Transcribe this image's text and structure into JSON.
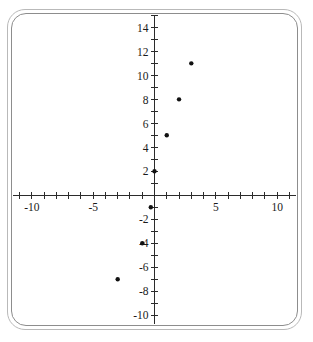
{
  "chart_data": {
    "type": "scatter",
    "title": "",
    "subtitle": "",
    "xlabel": "",
    "ylabel": "",
    "xlim": [
      -11.7,
      11.7
    ],
    "ylim": [
      -10.9,
      15.2
    ],
    "grid": false,
    "legend": null,
    "x_tick_step": 1,
    "y_tick_step": 1,
    "x_labeled_ticks": [
      -10,
      -5,
      5,
      10
    ],
    "y_labeled_ticks": [
      14,
      12,
      10,
      8,
      6,
      4,
      2,
      -2,
      -4,
      -6,
      -8,
      -10
    ],
    "x_tick_labels": [
      "-10",
      "-5",
      "5",
      "10"
    ],
    "y_tick_labels": [
      "14",
      "12",
      "10",
      "8",
      "6",
      "4",
      "2",
      "-2",
      "-4",
      "-6",
      "-8",
      "-10"
    ],
    "points": [
      {
        "x": -3,
        "y": -7
      },
      {
        "x": -1,
        "y": -4
      },
      {
        "x": -0.3,
        "y": -1
      },
      {
        "x": 0,
        "y": 2
      },
      {
        "x": 1,
        "y": 5
      },
      {
        "x": 2,
        "y": 8
      },
      {
        "x": 3,
        "y": 11
      }
    ],
    "marker": "dot",
    "marker_color": "#111111",
    "marker_size_px": 2.2,
    "axis_color": "#2b2b2b"
  },
  "frame": {
    "outer_border_color": "#b9b9b9",
    "inner_border_color": "#8d8d8d",
    "background": "#ffffff"
  }
}
